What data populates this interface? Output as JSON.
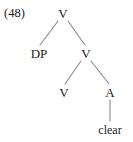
{
  "figure": {
    "example_number": "(48)",
    "kind": "syntactic-tree",
    "stroke_color": "#8a8a8a",
    "text_color": "#212121",
    "background_color": "#ffffff"
  },
  "tree": {
    "nodes": [
      {
        "id": "v-root",
        "label": "V",
        "x": 63,
        "y": 13
      },
      {
        "id": "dp",
        "label": "DP",
        "x": 39,
        "y": 53
      },
      {
        "id": "v-mid",
        "label": "V",
        "x": 86,
        "y": 53
      },
      {
        "id": "v-terminal",
        "label": "V",
        "x": 64,
        "y": 92
      },
      {
        "id": "a",
        "label": "A",
        "x": 110,
        "y": 92
      },
      {
        "id": "clear",
        "label": "clear",
        "x": 110,
        "y": 130
      }
    ],
    "edges": [
      {
        "from": "v-root",
        "to": "dp",
        "x1": 58,
        "y1": 21,
        "x2": 40,
        "y2": 45
      },
      {
        "from": "v-root",
        "to": "v-mid",
        "x1": 68,
        "y1": 21,
        "x2": 85,
        "y2": 45
      },
      {
        "from": "v-mid",
        "to": "v-terminal",
        "x1": 81,
        "y1": 61,
        "x2": 65,
        "y2": 84
      },
      {
        "from": "v-mid",
        "to": "a",
        "x1": 91,
        "y1": 61,
        "x2": 109,
        "y2": 84
      },
      {
        "from": "a",
        "to": "clear",
        "x1": 110,
        "y1": 100,
        "x2": 110,
        "y2": 121
      }
    ]
  }
}
